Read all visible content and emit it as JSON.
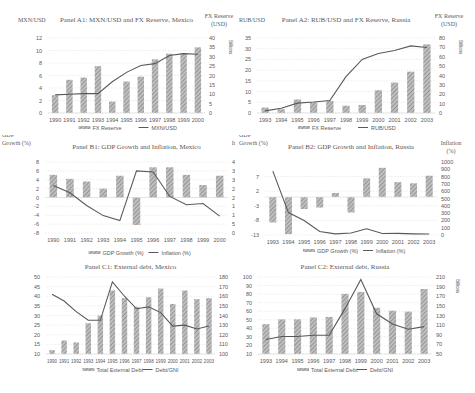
{
  "figure": {
    "colors": {
      "bar_fill": "#8c8c8c",
      "bar_hatch": "#bfbfbf",
      "line": "#595959",
      "grid": "#d9d9d9",
      "text": "#595959"
    }
  },
  "chart_data": [
    {
      "id": "A1",
      "type": "bar+line",
      "title": "Panel A1: MXN/USD and FX Reserve, Mexico",
      "left_axis_label": "MXN/USD",
      "right_axis_label": "FX Reserve (USD)",
      "right_axis_unit": "Billions",
      "categories": [
        "1990",
        "1991",
        "1992",
        "1993",
        "1994",
        "1995",
        "1996",
        "1997",
        "1998",
        "1999",
        "2000"
      ],
      "left_ticks": [
        0,
        2,
        4,
        6,
        8,
        10,
        12
      ],
      "right_ticks": [
        0,
        5,
        10,
        15,
        20,
        25,
        30,
        35,
        40
      ],
      "ylim_left": [
        0,
        12
      ],
      "ylim_right": [
        0,
        40
      ],
      "series": [
        {
          "name": "FX Reserve",
          "kind": "bar",
          "axis": "right",
          "values": [
            9.5,
            17.7,
            18.9,
            25,
            6.1,
            16.8,
            19.4,
            28.6,
            31.6,
            31.8,
            35
          ]
        },
        {
          "name": "MXN/USD",
          "kind": "line",
          "axis": "left",
          "values": [
            2.9,
            3.0,
            3.1,
            3.1,
            5.0,
            6.5,
            7.6,
            7.9,
            9.2,
            9.5,
            9.4
          ]
        }
      ],
      "legend": [
        "FX Reserve",
        "MXN/USD"
      ]
    },
    {
      "id": "A2",
      "type": "bar+line",
      "title": "Panel A2: RUB/USD and FX Reserve, Russia",
      "left_axis_label": "RUB/USD",
      "right_axis_label": "FX Reserve (USD)",
      "right_axis_unit": "Billions",
      "categories": [
        "1993",
        "1994",
        "1995",
        "1996",
        "1997",
        "1998",
        "1999",
        "2000",
        "2001",
        "2002",
        "2003"
      ],
      "left_ticks": [
        0,
        5,
        10,
        15,
        20,
        25,
        30,
        35
      ],
      "right_ticks": [
        0,
        10,
        20,
        30,
        40,
        50,
        60,
        70,
        80
      ],
      "ylim_left": [
        0,
        35
      ],
      "ylim_right": [
        0,
        80
      ],
      "series": [
        {
          "name": "FX Reserve",
          "kind": "bar",
          "axis": "right",
          "values": [
            5.8,
            4,
            14.4,
            11.3,
            13,
            7.8,
            8.5,
            24.3,
            32.5,
            44.1,
            73.2
          ]
        },
        {
          "name": "RUB/USD",
          "kind": "line",
          "axis": "left",
          "values": [
            1.0,
            2.2,
            4.6,
            5.1,
            5.8,
            17.0,
            25.0,
            27.8,
            29.2,
            31.3,
            30.6
          ]
        }
      ],
      "legend": [
        "FX Reserve",
        "RUB/USD"
      ]
    },
    {
      "id": "B1",
      "type": "bar+line",
      "title": "Panel B1: GDP Growth and Inflation, Mexico",
      "left_axis_label": "GDP Growth (%)",
      "right_axis_label": "Inflation (%)",
      "categories": [
        "1990",
        "1991",
        "1992",
        "1993",
        "1994",
        "1995",
        "1996",
        "1997",
        "1998",
        "1999",
        "2000"
      ],
      "left_ticks": [
        -8,
        -6,
        -4,
        -2,
        0,
        2,
        4,
        6,
        8
      ],
      "right_ticks": [
        0,
        5,
        10,
        15,
        20,
        25,
        30,
        35,
        40
      ],
      "ylim_left": [
        -8,
        8
      ],
      "ylim_right": [
        0,
        40
      ],
      "series": [
        {
          "name": "GDP Growth (%)",
          "kind": "bar",
          "axis": "left",
          "values": [
            5.1,
            4.2,
            3.6,
            2.0,
            4.9,
            -6.2,
            6.8,
            6.8,
            5.1,
            2.8,
            4.9
          ]
        },
        {
          "name": "Inflation (%)",
          "kind": "line",
          "axis": "right",
          "values": [
            26.7,
            22.7,
            15.5,
            9.8,
            7.0,
            35.0,
            34.4,
            20.6,
            15.9,
            16.6,
            9.5
          ]
        }
      ],
      "legend": [
        "GDP Growth (%)",
        "Inflation (%)"
      ]
    },
    {
      "id": "B2",
      "type": "bar+line",
      "title": "Panel B2: GDP Growth and Inflation, Russia",
      "left_axis_label": "GDP Growth (%)",
      "right_axis_label": "Inflation (%)",
      "categories": [
        "1993",
        "1994",
        "1995",
        "1996",
        "1997",
        "1998",
        "1999",
        "2000",
        "2001",
        "2002",
        "2003"
      ],
      "left_ticks": [
        -13,
        -8,
        -3,
        2,
        7
      ],
      "right_ticks": [
        0,
        100,
        200,
        300,
        400,
        500,
        600,
        700,
        800,
        900,
        1000
      ],
      "ylim_left": [
        -13,
        12
      ],
      "ylim_right": [
        0,
        1000
      ],
      "series": [
        {
          "name": "GDP Growth (%)",
          "kind": "bar",
          "axis": "left",
          "values": [
            -8.7,
            -12.7,
            -4.1,
            -3.6,
            1.4,
            -5.3,
            6.4,
            10.0,
            5.1,
            4.7,
            7.3
          ]
        },
        {
          "name": "Inflation (%)",
          "kind": "line",
          "axis": "right",
          "values": [
            875,
            307,
            198,
            48,
            15,
            28,
            86,
            21,
            22,
            16,
            14
          ]
        }
      ],
      "legend": [
        "GDP Growth (%)",
        "Inflation (%)"
      ]
    },
    {
      "id": "C1",
      "type": "bar+line",
      "title": "Panel C1: External debt, Mexico",
      "left_axis_label": "",
      "right_axis_unit": "Billions",
      "categories": [
        "1990",
        "1991",
        "1992",
        "1993",
        "1994",
        "1995",
        "1996",
        "1997",
        "1998",
        "1999",
        "2000",
        "2001",
        "2002",
        "2003"
      ],
      "left_ticks": [
        10,
        15,
        20,
        25,
        30,
        35,
        40,
        45,
        50
      ],
      "right_ticks": [
        100,
        110,
        120,
        130,
        140,
        150,
        160,
        170,
        180
      ],
      "ylim_left": [
        10,
        50
      ],
      "ylim_right": [
        100,
        180
      ],
      "series": [
        {
          "name": "Total External Debt",
          "kind": "bar",
          "axis": "right",
          "values": [
            104,
            114,
            112,
            132,
            140,
            166,
            158,
            149,
            159,
            168,
            152,
            166,
            157,
            158
          ]
        },
        {
          "name": "Debt/GNI",
          "kind": "line",
          "axis": "left",
          "values": [
            41,
            37.5,
            32,
            27.5,
            27.5,
            47.5,
            40,
            33.5,
            34.5,
            31.5,
            24.5,
            25,
            23,
            24.5
          ]
        }
      ],
      "legend": [
        "Total External Debt",
        "Debt/GNI"
      ]
    },
    {
      "id": "C2",
      "type": "bar+line",
      "title": "Panel C2: External debt, Russia",
      "left_axis_label": "",
      "right_axis_unit": "Billions",
      "categories": [
        "1993",
        "1994",
        "1995",
        "1996",
        "1997",
        "1998",
        "1999",
        "2000",
        "2001",
        "2002",
        "2003"
      ],
      "left_ticks": [
        10,
        20,
        30,
        40,
        50,
        60,
        70,
        80,
        90,
        100
      ],
      "right_ticks": [
        50,
        70,
        90,
        110,
        130,
        150,
        170,
        190,
        210
      ],
      "ylim_left": [
        10,
        100
      ],
      "ylim_right": [
        50,
        210
      ],
      "series": [
        {
          "name": "Total External Debt",
          "kind": "bar",
          "axis": "right",
          "values": [
            112,
            122,
            122,
            126,
            127,
            175,
            179,
            146,
            140,
            138,
            185
          ]
        },
        {
          "name": "Debt/GNI",
          "kind": "line",
          "axis": "left",
          "values": [
            27,
            30.5,
            30.5,
            32,
            32,
            63,
            97,
            57,
            45,
            39,
            42
          ]
        }
      ],
      "legend": [
        "Total External Debt",
        "Debt/GNI"
      ]
    }
  ]
}
